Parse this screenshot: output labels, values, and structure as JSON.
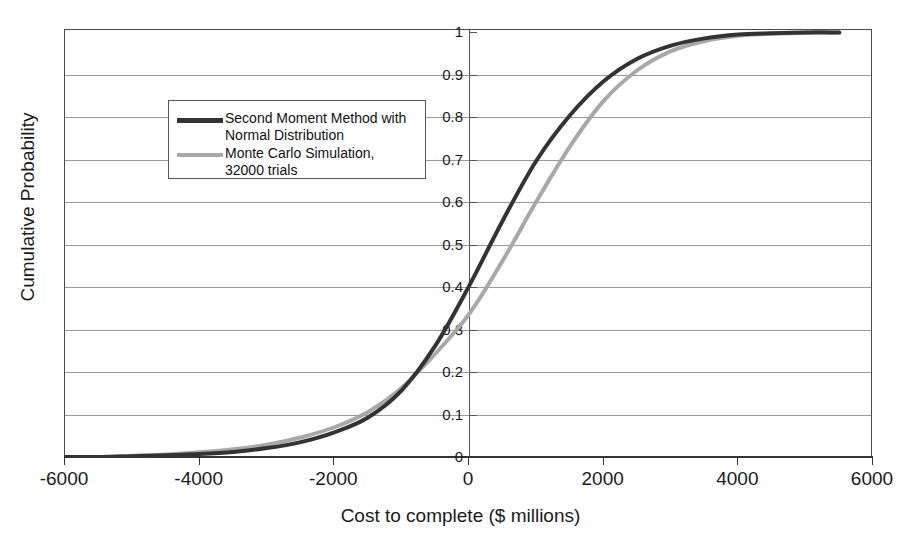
{
  "chart_data": {
    "type": "line",
    "title": "",
    "xlabel": "Cost to complete ($ millions)",
    "ylabel": "Cumulative Probability",
    "xlim": [
      -6000,
      6000
    ],
    "ylim": [
      0,
      1
    ],
    "xticks": [
      "-6000",
      "-4000",
      "-2000",
      "0",
      "2000",
      "4000",
      "6000"
    ],
    "xtick_values": [
      -6000,
      -4000,
      -2000,
      0,
      2000,
      4000,
      6000
    ],
    "yticks": [
      "0",
      "0.1",
      "0.2",
      "0.3",
      "0.4",
      "0.5",
      "0.6",
      "0.7",
      "0.8",
      "0.9",
      "1"
    ],
    "ytick_values": [
      0,
      0.1,
      0.2,
      0.3,
      0.4,
      0.5,
      0.6,
      0.7,
      0.8,
      0.9,
      1
    ],
    "grid": "horizontal",
    "legend_position": "upper-left-inside",
    "series": [
      {
        "name": "Second Moment Method with Normal Distribution",
        "color": "#333333",
        "x": [
          -6000,
          -5500,
          -5000,
          -4500,
          -4000,
          -3500,
          -3000,
          -2500,
          -2000,
          -1500,
          -1000,
          -500,
          0,
          500,
          1000,
          1500,
          2000,
          2500,
          3000,
          3500,
          4000,
          4500,
          5000,
          5500
        ],
        "values": [
          0.0,
          0.0,
          0.002,
          0.004,
          0.007,
          0.012,
          0.021,
          0.035,
          0.058,
          0.093,
          0.157,
          0.262,
          0.402,
          0.556,
          0.697,
          0.804,
          0.884,
          0.937,
          0.968,
          0.985,
          0.994,
          0.997,
          0.999,
          0.999
        ]
      },
      {
        "name": "Monte Carlo Simulation, 32000 trials",
        "color": "#a8a8a8",
        "x": [
          -6000,
          -5500,
          -5000,
          -4500,
          -4000,
          -3500,
          -3000,
          -2500,
          -2000,
          -1500,
          -1000,
          -500,
          0,
          500,
          1000,
          1500,
          2000,
          2500,
          3000,
          3500,
          4000,
          4500,
          5000,
          5500
        ],
        "values": [
          0.0,
          0.0,
          0.003,
          0.006,
          0.011,
          0.018,
          0.029,
          0.046,
          0.07,
          0.106,
          0.163,
          0.243,
          0.336,
          0.462,
          0.601,
          0.731,
          0.838,
          0.91,
          0.955,
          0.979,
          0.991,
          0.996,
          0.998,
          0.999
        ]
      }
    ]
  },
  "legend": {
    "entries": [
      {
        "label": "Second Moment Method with\nNormal Distribution",
        "color": "#333333"
      },
      {
        "label": "Monte Carlo Simulation,\n32000 trials",
        "color": "#a8a8a8"
      }
    ]
  },
  "axes": {
    "x_title": "Cost to complete ($ millions)",
    "y_title": "Cumulative Probability"
  },
  "colors": {
    "series_black": "#333333",
    "series_gray": "#a8a8a8",
    "grid": "#9a9a9a",
    "frame": "#4a4a4a",
    "axis": "#333333",
    "text": "#1a1a1a",
    "background": "#ffffff"
  }
}
